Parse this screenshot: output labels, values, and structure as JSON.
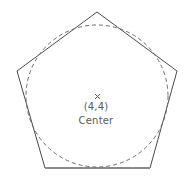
{
  "figure": {
    "title": "",
    "type": "geometry-diagram",
    "width": 192,
    "height": 179,
    "background_color": "#ffffff"
  },
  "labels": {
    "coordinate": "(4,4)",
    "center_word": "Center",
    "marker_glyph": "×",
    "text_color": "#5a5a5a"
  },
  "shapes": {
    "pentagon": {
      "name": "regular-pentagon",
      "stroke_color": "#4a4a4a",
      "stroke_width": 1,
      "fill": "none",
      "sides": 5,
      "vertices": [
        [
          97,
          12
        ],
        [
          177,
          71
        ],
        [
          150,
          168
        ],
        [
          45,
          168
        ],
        [
          17,
          71
        ]
      ],
      "bottom_edge_stroke_color": "#8a8a8a",
      "bottom_edge_stroke_width": 2
    },
    "inscribed_circle": {
      "name": "inscribed-circle",
      "stroke_color": "#6e6e6e",
      "stroke_width": 1,
      "fill": "none",
      "dash_pattern": "4 3",
      "center": [
        97,
        96
      ],
      "radius": 71
    },
    "center_marker": {
      "name": "center-cross-marker",
      "stroke_color": "#5a5a5a",
      "stroke_width": 1,
      "position": [
        97,
        96
      ],
      "size": 5
    }
  },
  "chart_data": {
    "type": "scatter",
    "title": "",
    "xlabel": "",
    "ylabel": "",
    "annotations": [
      {
        "label": "(4,4)",
        "sublabel": "Center",
        "x": 4,
        "y": 4,
        "marker": "x"
      }
    ],
    "series": [
      {
        "name": "pentagon-vertices",
        "points": [
          [
            97,
            12
          ],
          [
            177,
            71
          ],
          [
            150,
            168
          ],
          [
            45,
            168
          ],
          [
            17,
            71
          ]
        ]
      }
    ],
    "grid": false,
    "legend": "none"
  }
}
